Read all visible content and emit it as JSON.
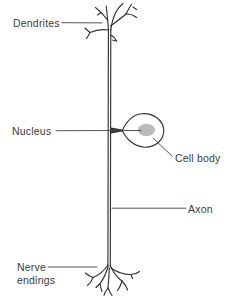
{
  "figure": {
    "type": "labeled-diagram",
    "labels": {
      "dendrites": "Dendrites",
      "nucleus": "Nucleus",
      "cell_body": "Cell body",
      "axon": "Axon",
      "nerve_endings": "Nerve endings"
    },
    "colors": {
      "background": "#ffffff",
      "line": "#323232",
      "leader_line": "#4a4a4a",
      "text": "#3b3b3b",
      "nucleus_fill": "#b4b4b4"
    }
  }
}
